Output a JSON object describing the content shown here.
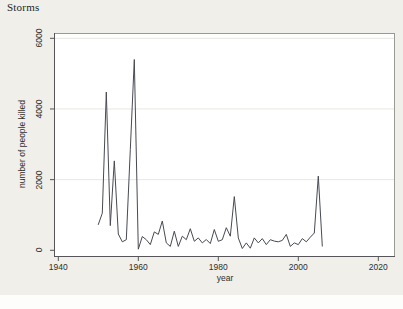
{
  "window": {
    "title": "Storms"
  },
  "chart_data": {
    "type": "line",
    "title": "Storms",
    "xlabel": "year",
    "ylabel": "number of people killed",
    "x_ticks": [
      1940,
      1960,
      1980,
      2000,
      2020
    ],
    "y_ticks": [
      0,
      2000,
      4000,
      6000
    ],
    "xlim": [
      1939,
      2024
    ],
    "ylim": [
      -190,
      6150
    ],
    "grid": "horizontal-at-y-ticks-except-zero",
    "legend": "none",
    "series": [
      {
        "name": "number of people killed",
        "x": [
          1950,
          1951,
          1952,
          1953,
          1954,
          1955,
          1956,
          1957,
          1958,
          1959,
          1960,
          1961,
          1962,
          1963,
          1964,
          1965,
          1966,
          1967,
          1968,
          1969,
          1970,
          1971,
          1972,
          1973,
          1974,
          1975,
          1976,
          1977,
          1978,
          1979,
          1980,
          1981,
          1982,
          1983,
          1984,
          1985,
          1986,
          1987,
          1988,
          1989,
          1990,
          1991,
          1992,
          1993,
          1994,
          1995,
          1996,
          1997,
          1998,
          1999,
          2000,
          2001,
          2002,
          2003,
          2004,
          2005,
          2006
        ],
        "values": [
          730,
          1050,
          4480,
          700,
          2530,
          460,
          240,
          300,
          2850,
          5400,
          30,
          390,
          300,
          160,
          520,
          450,
          830,
          210,
          110,
          540,
          110,
          400,
          300,
          610,
          255,
          350,
          210,
          305,
          190,
          590,
          255,
          300,
          640,
          400,
          1520,
          350,
          50,
          210,
          60,
          350,
          210,
          330,
          160,
          300,
          260,
          240,
          280,
          450,
          110,
          210,
          160,
          330,
          240,
          370,
          490,
          2100,
          120
        ]
      }
    ],
    "colors": {
      "canvas_background": "#f0efe9",
      "plot_background": "#ffffff",
      "grid": "#e7e7e1",
      "frame": "#9a9a95",
      "axis": "#55555a",
      "line": "#474a52",
      "text": "#2e2e2e"
    }
  }
}
